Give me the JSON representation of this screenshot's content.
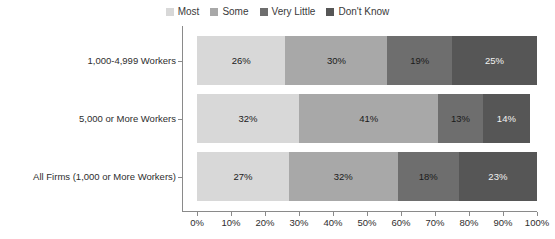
{
  "chart_data": {
    "type": "bar",
    "orientation": "horizontal",
    "stacked": true,
    "stack_mode": "percent",
    "title": "",
    "subtitle": "",
    "xlabel": "",
    "ylabel": "",
    "xlim": [
      0,
      100
    ],
    "grid": false,
    "legend_position": "top-center",
    "categories": [
      "1,000-4,999 Workers",
      "5,000 or More Workers",
      "All Firms (1,000 or More Workers)"
    ],
    "series": [
      {
        "name": "Most",
        "color": "#d8d8d8",
        "label_color": "#1a1a1a",
        "values": [
          26,
          30,
          27
        ]
      },
      {
        "name": "Some",
        "color": "#a8a8a8",
        "label_color": "#1a1a1a",
        "values": [
          30,
          41,
          32
        ]
      },
      {
        "name": "Very Little",
        "color": "#6e6e6e",
        "label_color": "#1a1a1a",
        "values": [
          19,
          13,
          18
        ]
      },
      {
        "name": "Don't Know",
        "color": "#565656",
        "label_color": "#f2f2f2",
        "values": [
          25,
          14,
          23
        ]
      }
    ],
    "xticks": [
      0,
      10,
      20,
      30,
      40,
      50,
      60,
      70,
      80,
      90,
      100
    ],
    "xticklabels": [
      "0%",
      "10%",
      "20%",
      "30%",
      "40%",
      "50%",
      "60%",
      "70%",
      "80%",
      "90%",
      "100%"
    ],
    "data_labels": [
      [
        "26%",
        "30%",
        "19%",
        "25%"
      ],
      [
        "32%",
        "41%",
        "13%",
        "14%"
      ],
      [
        "27%",
        "32%",
        "18%",
        "23%"
      ]
    ]
  },
  "legend": {
    "items": [
      {
        "label": "Most",
        "color": "#d8d8d8"
      },
      {
        "label": "Some",
        "color": "#a8a8a8"
      },
      {
        "label": "Very Little",
        "color": "#6e6e6e"
      },
      {
        "label": "Don't Know",
        "color": "#565656"
      }
    ]
  },
  "axis": {
    "category_labels": [
      "1,000-4,999 Workers",
      "5,000 or More Workers",
      "All Firms (1,000 or More Workers)"
    ],
    "x_tick_labels": [
      "0%",
      "10%",
      "20%",
      "30%",
      "40%",
      "50%",
      "60%",
      "70%",
      "80%",
      "90%",
      "100%"
    ]
  },
  "colors": {
    "axis_line": "#8a8a8a",
    "text": "#2e2e2e",
    "background": "#ffffff"
  }
}
